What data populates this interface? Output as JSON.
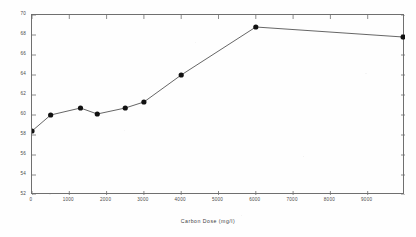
{
  "chart_data": {
    "type": "line",
    "title": "",
    "xlabel": "Carbon Dose (mg/l)",
    "ylabel": "AVERAGE METHANE CONTENT (%)",
    "xlim": [
      0,
      10000
    ],
    "ylim": [
      52,
      70
    ],
    "grid": false,
    "legend": null,
    "marker": "filled-circle",
    "xticks": [
      0,
      1000,
      2000,
      3000,
      4000,
      5000,
      6000,
      7000,
      8000,
      9000
    ],
    "xticklabels": [
      "0",
      "1000",
      "2000",
      "3000",
      "4000",
      "5000",
      "6000",
      "7000",
      "8000",
      "9000"
    ],
    "yticks": [
      52,
      54,
      56,
      58,
      60,
      62,
      64,
      66,
      68,
      70
    ],
    "yticklabels": [
      "52",
      "54",
      "56",
      "58",
      "60",
      "62",
      "64",
      "66",
      "68",
      "70"
    ],
    "x": [
      0,
      500,
      1300,
      1750,
      2500,
      3000,
      4000,
      6000,
      9950
    ],
    "values": [
      58.4,
      60.0,
      60.7,
      60.1,
      60.7,
      61.3,
      64.0,
      68.8,
      67.8
    ],
    "series": [
      {
        "name": "Average methane content",
        "x": [
          0,
          500,
          1300,
          1750,
          2500,
          3000,
          4000,
          6000,
          9950
        ],
        "values": [
          58.4,
          60.0,
          60.7,
          60.1,
          60.7,
          61.3,
          64.0,
          68.8,
          67.8
        ]
      }
    ]
  },
  "style": {
    "line_color": "#555555",
    "marker_color": "#111111",
    "axis_color": "#6f6f6f",
    "text_color": "#4a4a4a"
  }
}
